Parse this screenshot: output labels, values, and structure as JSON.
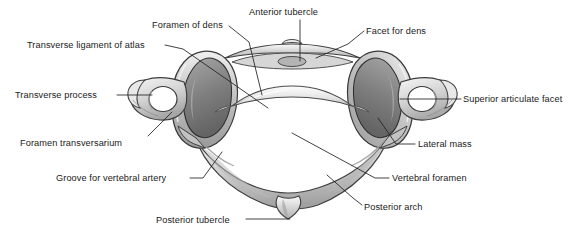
{
  "figure": {
    "background_color": "#ffffff",
    "line_color": "#231f20",
    "text_color": "#1a1a1a",
    "bone_fill_light": "#f2f2f2",
    "bone_fill_mid": "#c9c9c9",
    "bone_fill_dark": "#8d8d8d",
    "bone_outline": "#3a3a3a"
  },
  "labels": [
    {
      "id": "foramen-of-dens",
      "text": "Foramen of dens",
      "align": "left",
      "x": 152,
      "y": 20
    },
    {
      "id": "anterior-tubercle",
      "text": "Anterior tubercle",
      "align": "left",
      "x": 249,
      "y": 7
    },
    {
      "id": "facet-for-dens",
      "text": "Facet for dens",
      "align": "left",
      "x": 366,
      "y": 26
    },
    {
      "id": "transverse-ligament-of-atlas",
      "text": "Transverse ligament of atlas",
      "align": "left",
      "x": 27,
      "y": 40
    },
    {
      "id": "transverse-process",
      "text": "Transverse process",
      "align": "left",
      "x": 15,
      "y": 90
    },
    {
      "id": "superior-articulate-facet",
      "text": "Superior articulate facet",
      "align": "left",
      "x": 463,
      "y": 94
    },
    {
      "id": "foramen-transversarium",
      "text": "Foramen transversarium",
      "align": "left",
      "x": 20,
      "y": 138
    },
    {
      "id": "lateral-mass",
      "text": "Lateral mass",
      "align": "left",
      "x": 418,
      "y": 139
    },
    {
      "id": "groove-for-vertebral-artery",
      "text": "Groove for vertebral artery",
      "align": "left",
      "x": 56,
      "y": 173
    },
    {
      "id": "vertebral-foramen",
      "text": "Vertebral foramen",
      "align": "left",
      "x": 392,
      "y": 173
    },
    {
      "id": "posterior-arch",
      "text": "Posterior arch",
      "align": "left",
      "x": 364,
      "y": 202
    },
    {
      "id": "posterior-tubercle",
      "text": "Posterior tubercle",
      "align": "left",
      "x": 156,
      "y": 215
    }
  ],
  "leaders": [
    {
      "id": "leader-foramen-of-dens",
      "d": "M 229 26 L 249 42 L 262 95"
    },
    {
      "id": "leader-anterior-tubercle",
      "d": "M 300 20 L 300 61"
    },
    {
      "id": "leader-facet-for-dens",
      "d": "M 364 31 L 348 44 L 316 58"
    },
    {
      "id": "leader-transverse-ligament",
      "d": "M 165 45 L 183 49 L 268 108"
    },
    {
      "id": "leader-transverse-process",
      "d": "M 117 95 L 152 95"
    },
    {
      "id": "leader-superior-articulate-facet",
      "d": "M 461 99 L 400 99"
    },
    {
      "id": "leader-foramen-transversarium",
      "d": "M 148 136 L 172 112"
    },
    {
      "id": "leader-lateral-mass",
      "d": "M 415 144 L 396 144 L 378 118"
    },
    {
      "id": "leader-groove-vertebral-artery",
      "d": "M 190 178 L 203 178 L 222 152"
    },
    {
      "id": "leader-vertebral-foramen",
      "d": "M 389 178 L 375 178 L 292 133"
    },
    {
      "id": "leader-posterior-arch",
      "d": "M 362 205 L 353 198 L 327 175"
    },
    {
      "id": "leader-posterior-tubercle",
      "d": "M 246 219 L 290 219"
    }
  ],
  "structures": [
    {
      "id": "anterior-arch",
      "name": "Anterior arch of atlas"
    },
    {
      "id": "anterior-tubercle",
      "name": "Anterior tubercle"
    },
    {
      "id": "dens-facet",
      "name": "Facet for dens"
    },
    {
      "id": "left-lateral-mass",
      "name": "Left lateral mass"
    },
    {
      "id": "right-lateral-mass",
      "name": "Right lateral mass"
    },
    {
      "id": "left-superior-facet",
      "name": "Left superior articular facet"
    },
    {
      "id": "right-superior-facet",
      "name": "Right superior articular facet"
    },
    {
      "id": "left-transverse-process",
      "name": "Left transverse process"
    },
    {
      "id": "right-transverse-process",
      "name": "Right transverse process"
    },
    {
      "id": "left-foramen-transversarium",
      "name": "Left foramen transversarium"
    },
    {
      "id": "right-foramen-transversarium",
      "name": "Right foramen transversarium"
    },
    {
      "id": "posterior-arch",
      "name": "Posterior arch"
    },
    {
      "id": "posterior-tubercle",
      "name": "Posterior tubercle"
    },
    {
      "id": "vertebral-foramen",
      "name": "Vertebral foramen"
    },
    {
      "id": "groove-vertebral-artery",
      "name": "Groove for vertebral artery"
    },
    {
      "id": "transverse-ligament",
      "name": "Transverse ligament of atlas"
    }
  ]
}
